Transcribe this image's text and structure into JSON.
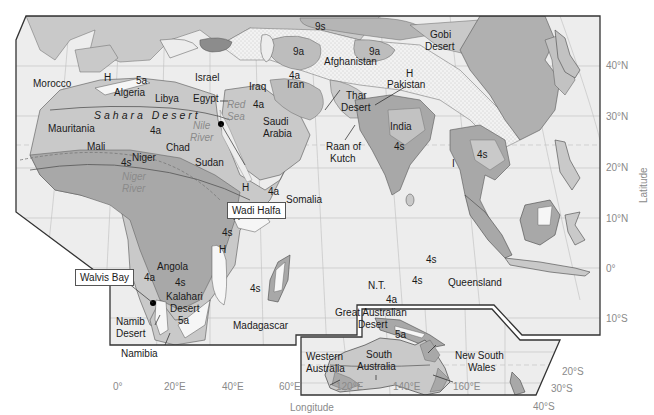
{
  "colors": {
    "background": "#ffffff",
    "ocean": "#ededed",
    "arid_4a_5a": "#c9c9c9",
    "semiarid_4s": "#a8a8a8",
    "highland_H": "#f6f6f6",
    "cold_9a_9s": "#bdbdbd",
    "desert_stippled": "#f2f2f2",
    "border": "#333333",
    "grid": "#bbbbbb",
    "axis_text": "#8a8a8a",
    "label_text": "#1a1a1a"
  },
  "axes": {
    "x_title": "Longitude",
    "y_title": "Latitude",
    "x_ticks": [
      "0°",
      "20°E",
      "40°E",
      "60°E",
      "120°E",
      "140°E",
      "160°E"
    ],
    "y_ticks_main": [
      "40°N",
      "30°N",
      "20°N",
      "10°N",
      "0°",
      "10°S"
    ],
    "y_ticks_inset": [
      "20°S",
      "30°S",
      "40°S"
    ]
  },
  "callouts": {
    "wadi_halfa": "Wadi Halfa",
    "walvis_bay": "Walvis Bay"
  },
  "labels": {
    "morocco": "Morocco",
    "h_morocco": "H",
    "z5a_algeria": "5a",
    "algeria": "Algeria",
    "libya": "Libya",
    "israel": "Israel",
    "egypt": "Egypt",
    "red_sea_1": "Red",
    "red_sea_2": "Sea",
    "sahara": "Sahara Desert",
    "mauritania": "Mauritania",
    "z4a_sahara": "4a",
    "nile_1": "Nile",
    "nile_2": "River",
    "mali": "Mali",
    "chad": "Chad",
    "niger": "Niger",
    "z4s_niger": "4s",
    "sudan": "Sudan",
    "niger_river_1": "Niger",
    "niger_river_2": "River",
    "iraq": "Iraq",
    "z4a_arabia": "4a",
    "saudi_1": "Saudi",
    "saudi_2": "Arabia",
    "z9s": "9s",
    "z9a_west": "9a",
    "z9a_east": "9a",
    "afghanistan": "Afghanistan",
    "z4a_iran": "4a",
    "iran": "Iran",
    "gobi_1": "Gobi",
    "gobi_2": "Desert",
    "h_pakistan": "H",
    "pakistan": "Pakistan",
    "thar_1": "Thar",
    "thar_2": "Desert",
    "india": "India",
    "z4s_india": "4s",
    "raan_1": "Raan of",
    "raan_2": "Kutch",
    "z4s_indochina": "4s",
    "i_marker": "I",
    "h_ethiopia": "H",
    "z4a_somalia": "4a",
    "somalia": "Somalia",
    "h_eastafrica_1": "H",
    "z4s_eastafrica": "4s",
    "h_eastafrica_2": "H",
    "angola": "Angola",
    "z4a_angola": "4a",
    "z4s_angola": "4s",
    "kalahari_1": "Kalahari",
    "kalahari_2": "Desert",
    "z5a_kalahari": "5a",
    "namib_1": "Namib",
    "namib_2": "Desert",
    "namibia": "Namibia",
    "z4s_madagascar": "4s",
    "madagascar": "Madagascar",
    "z4s_png": "4s",
    "z4s_qld": "4s",
    "nt": "N.T.",
    "z4a_aus": "4a",
    "queensland": "Queensland",
    "gad_1": "Great Australian",
    "gad_2": "Desert",
    "z5a_aus": "5a",
    "wa_1": "Western",
    "wa_2": "Australia",
    "sa_1": "South",
    "sa_2": "Australia",
    "nsw_1": "New South",
    "nsw_2": "Wales"
  }
}
